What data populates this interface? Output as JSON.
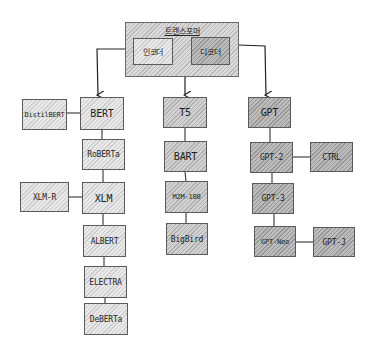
{
  "diagram": {
    "root": {
      "title": "트랜스포머",
      "encoder": "인코더",
      "decoder": "디코더"
    },
    "encoder_branch": {
      "main": [
        "BERT",
        "RoBERTa",
        "XLM",
        "ALBERT",
        "ELECTRA",
        "DeBERTa"
      ],
      "side": {
        "BERT": "DistilBERT",
        "XLM": "XLM-R"
      }
    },
    "encoder_decoder_branch": {
      "main": [
        "T5",
        "BART",
        "M2M-100",
        "BigBird"
      ]
    },
    "decoder_branch": {
      "main": [
        "GPT",
        "GPT-2",
        "GPT-3",
        "GPT-Neo"
      ],
      "side": {
        "GPT-2": "CTRL",
        "GPT-Neo": "GPT-J"
      }
    },
    "edges": [
      [
        "인코더",
        "BERT"
      ],
      [
        "트랜스포머",
        "T5"
      ],
      [
        "디코더",
        "GPT"
      ],
      [
        "BERT",
        "RoBERTa"
      ],
      [
        "RoBERTa",
        "XLM"
      ],
      [
        "XLM",
        "ALBERT"
      ],
      [
        "ALBERT",
        "ELECTRA"
      ],
      [
        "ELECTRA",
        "DeBERTa"
      ],
      [
        "DistilBERT",
        "BERT"
      ],
      [
        "XLM-R",
        "XLM"
      ],
      [
        "T5",
        "BART"
      ],
      [
        "BART",
        "M2M-100"
      ],
      [
        "M2M-100",
        "BigBird"
      ],
      [
        "GPT",
        "GPT-2"
      ],
      [
        "GPT-2",
        "GPT-3"
      ],
      [
        "GPT-3",
        "GPT-Neo"
      ],
      [
        "GPT-2",
        "CTRL"
      ],
      [
        "GPT-Neo",
        "GPT-J"
      ]
    ],
    "colors": {
      "encoder_fill": "#e9e9e9",
      "encdec_fill": "#d2d2d2",
      "decoder_fill": "#bdbdbd",
      "line": "#333333"
    }
  }
}
